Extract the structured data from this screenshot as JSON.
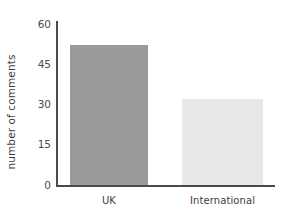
{
  "chart_data": {
    "type": "bar",
    "title": "",
    "subtitle": "",
    "xlabel": "",
    "ylabel": "number of comments",
    "categories": [
      "UK",
      "International"
    ],
    "values": [
      52,
      32
    ],
    "series": [
      {
        "name": "number of comments",
        "values": [
          52,
          32
        ]
      }
    ],
    "ylim": [
      0,
      60
    ],
    "yticks": [
      0,
      15,
      30,
      45,
      60
    ],
    "ytick_labels": [
      "0",
      "15",
      "30",
      "45",
      "60"
    ],
    "grid": false,
    "legend": false,
    "legend_position": "none",
    "bar_colors": [
      "#9a9a9a",
      "#e8e8e8"
    ],
    "axis_color": "#4a4a4a",
    "background": "#ffffff",
    "annotations": []
  },
  "axis": {
    "y_title": "number of comments",
    "tick_0": "0",
    "tick_1": "15",
    "tick_2": "30",
    "tick_3": "45",
    "tick_4": "60"
  },
  "categories": {
    "cat_0": "UK",
    "cat_1": "International"
  }
}
